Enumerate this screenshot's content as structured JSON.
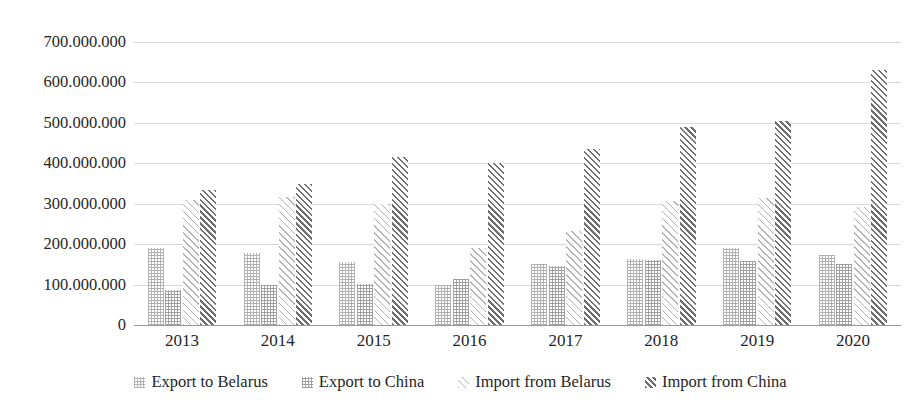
{
  "chart_data": {
    "type": "bar",
    "title": "",
    "subtitle": "",
    "xlabel": "",
    "ylabel": "",
    "categories": [
      "2013",
      "2014",
      "2015",
      "2016",
      "2017",
      "2018",
      "2019",
      "2020"
    ],
    "ylim": [
      0,
      700000000
    ],
    "ytick_values": [
      0,
      100000000,
      200000000,
      300000000,
      400000000,
      500000000,
      600000000,
      700000000
    ],
    "ytick_labels": [
      "0",
      "100.000.000",
      "200.000.000",
      "300.000.000",
      "400.000.000",
      "500.000.000",
      "600.000.000",
      "700.000.000"
    ],
    "grid": true,
    "legend_position": "bottom",
    "series": [
      {
        "name": "Export to Belarus",
        "pattern": "fine-dotted-light",
        "color": "#b0b0b0",
        "values": [
          190000000,
          178000000,
          155000000,
          100000000,
          152000000,
          163000000,
          190000000,
          173000000
        ]
      },
      {
        "name": "Export to China",
        "pattern": "fine-dotted-dark",
        "color": "#9e9e9e",
        "values": [
          87000000,
          100000000,
          102000000,
          115000000,
          147000000,
          160000000,
          158000000,
          150000000
        ]
      },
      {
        "name": "Import from Belarus",
        "pattern": "diagonal-hatch-light",
        "color": "#b4b4b4",
        "values": [
          310000000,
          316000000,
          300000000,
          190000000,
          232000000,
          307000000,
          315000000,
          292000000
        ]
      },
      {
        "name": "Import from China",
        "pattern": "diagonal-hatch-dark",
        "color": "#6e6e6e",
        "values": [
          335000000,
          350000000,
          415000000,
          400000000,
          435000000,
          490000000,
          505000000,
          630000000
        ]
      }
    ]
  }
}
